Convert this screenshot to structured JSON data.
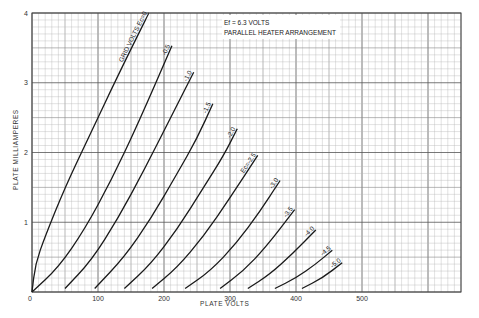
{
  "chart_data": {
    "type": "line",
    "title": "",
    "annotation": [
      "Ef = 6.3 VOLTS",
      "PARALLEL HEATER ARRANGEMENT"
    ],
    "xlabel": "PLATE VOLTS",
    "ylabel": "PLATE MILLIAMPERES",
    "xlim": [
      0,
      650
    ],
    "ylim": [
      0,
      4
    ],
    "x_ticks": [
      0,
      100,
      200,
      300,
      400,
      500
    ],
    "y_ticks": [
      1,
      2,
      3,
      4
    ],
    "grid": true,
    "legend": "curve labels inline (grid volts Ec)",
    "series": [
      {
        "name": "GRID VOLTS Ec=0",
        "label": "GRID VOLTS Ec=0",
        "x": [
          0,
          5,
          20,
          50,
          90,
          130,
          177
        ],
        "y": [
          0,
          0.4,
          0.8,
          1.5,
          2.3,
          3.1,
          4.0
        ]
      },
      {
        "name": "-0.5",
        "label": "-0.5",
        "x": [
          0,
          40,
          80,
          120,
          160,
          212
        ],
        "y": [
          0,
          0.35,
          0.9,
          1.6,
          2.4,
          3.53
        ]
      },
      {
        "name": "-1.0",
        "label": "-1.0",
        "x": [
          50,
          90,
          130,
          170,
          210,
          245
        ],
        "y": [
          0.05,
          0.45,
          1.05,
          1.75,
          2.5,
          3.15
        ]
      },
      {
        "name": "-1.5",
        "label": "-1.5",
        "x": [
          95,
          140,
          180,
          220,
          250,
          274
        ],
        "y": [
          0.05,
          0.5,
          1.05,
          1.7,
          2.2,
          2.7
        ]
      },
      {
        "name": "-2.0",
        "label": "-2.0",
        "x": [
          140,
          180,
          220,
          260,
          290,
          311
        ],
        "y": [
          0.05,
          0.4,
          0.9,
          1.5,
          1.95,
          2.34
        ]
      },
      {
        "name": "Ec=-2.5",
        "label": "Ec=-2.5",
        "x": [
          182,
          220,
          260,
          300,
          342
        ],
        "y": [
          0.05,
          0.35,
          0.8,
          1.35,
          1.96
        ]
      },
      {
        "name": "-3.0",
        "label": "-3.0",
        "x": [
          232,
          270,
          310,
          345,
          376
        ],
        "y": [
          0.05,
          0.3,
          0.7,
          1.15,
          1.6
        ]
      },
      {
        "name": "-3.5",
        "label": "-3.5",
        "x": [
          285,
          320,
          355,
          398
        ],
        "y": [
          0.05,
          0.3,
          0.65,
          1.18
        ]
      },
      {
        "name": "-4.0",
        "label": "-4.0",
        "x": [
          327,
          360,
          395,
          430
        ],
        "y": [
          0.05,
          0.25,
          0.55,
          0.89
        ]
      },
      {
        "name": "-4.5",
        "label": "-4.5",
        "x": [
          368,
          400,
          430,
          455
        ],
        "y": [
          0.05,
          0.2,
          0.4,
          0.6
        ]
      },
      {
        "name": "-5.0",
        "label": "-5.0",
        "x": [
          409,
          440,
          470
        ],
        "y": [
          0.05,
          0.2,
          0.42
        ]
      }
    ]
  }
}
